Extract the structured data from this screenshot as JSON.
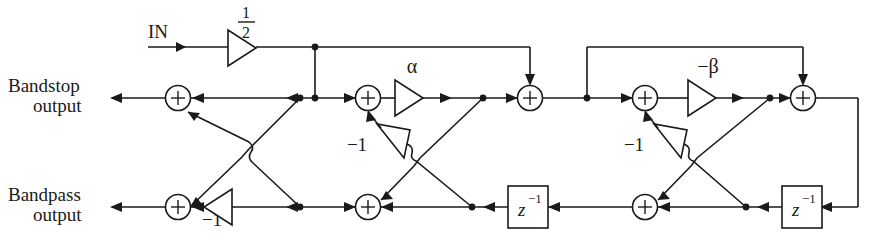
{
  "figure": {
    "kind": "signal-flow-diagram",
    "width": 882,
    "height": 241,
    "line_color": "#1a1a1a",
    "background_color": "#ffffff"
  },
  "labels": {
    "input": "IN",
    "bandstop_line1": "Bandstop",
    "bandstop_line2": "output",
    "bandpass_line1": "Bandpass",
    "bandpass_line2": "output",
    "half_numerator": "1",
    "half_denominator": "2",
    "alpha": "α",
    "neg_beta": "−β",
    "neg_one_a": "−1",
    "neg_one_b": "−1",
    "neg_one_c": "−1",
    "delay_base_1": "z",
    "delay_exp_1": "−1",
    "delay_base_2": "z",
    "delay_exp_2": "−1",
    "adder_symbol": "+"
  },
  "blocks": {
    "gains": [
      {
        "name": "input-gain-half",
        "label": "1/2",
        "x": 228,
        "y": 48
      },
      {
        "name": "gain-alpha",
        "label": "α",
        "x": 395,
        "y": 98
      },
      {
        "name": "gain-neg-beta",
        "label": "−β",
        "x": 688,
        "y": 98
      },
      {
        "name": "gain-neg-one-left",
        "label": "−1",
        "x": 215,
        "y": 207
      },
      {
        "name": "gain-neg-one-mid",
        "label": "−1",
        "x": 400,
        "y": 140
      },
      {
        "name": "gain-neg-one-right",
        "label": "−1",
        "x": 690,
        "y": 140
      }
    ],
    "adders": [
      {
        "name": "adder-bandstop-1",
        "x": 178,
        "y": 98
      },
      {
        "name": "adder-bandstop-2",
        "x": 368,
        "y": 98
      },
      {
        "name": "adder-bandstop-3",
        "x": 530,
        "y": 98
      },
      {
        "name": "adder-bandstop-4",
        "x": 645,
        "y": 98
      },
      {
        "name": "adder-bandstop-5",
        "x": 803,
        "y": 98
      },
      {
        "name": "adder-bandpass-1",
        "x": 178,
        "y": 207
      },
      {
        "name": "adder-bandpass-2",
        "x": 368,
        "y": 207
      },
      {
        "name": "adder-bandpass-3",
        "x": 645,
        "y": 207
      }
    ],
    "delays": [
      {
        "name": "delay-z-inverse-1",
        "label": "z⁻¹",
        "x": 508,
        "y": 186
      },
      {
        "name": "delay-z-inverse-2",
        "label": "z⁻¹",
        "x": 782,
        "y": 186
      }
    ]
  },
  "rows": {
    "top_feed_y": 47,
    "bandstop_y": 98,
    "bandpass_y": 207
  }
}
